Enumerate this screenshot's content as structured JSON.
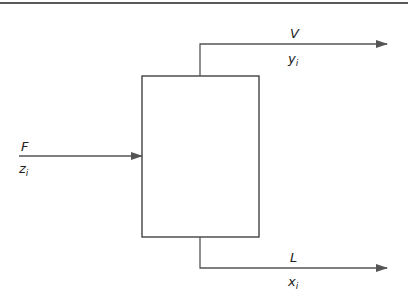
{
  "diagram": {
    "type": "flash-separation-unit",
    "colors": {
      "stroke": "#333333",
      "arrow": "#555555",
      "rule": "#222222",
      "background": "#ffffff"
    },
    "unit": {
      "shape": "rectangle",
      "x": 142,
      "y": 76,
      "width": 117,
      "height": 161
    },
    "streams": {
      "feed": {
        "name": "F",
        "composition_base": "z",
        "composition_sub": "i",
        "direction": "in"
      },
      "vapor": {
        "name": "V",
        "composition_base": "y",
        "composition_sub": "i",
        "direction": "out"
      },
      "liquid": {
        "name": "L",
        "composition_base": "x",
        "composition_sub": "i",
        "direction": "out"
      }
    }
  }
}
